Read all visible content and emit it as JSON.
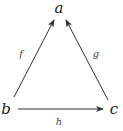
{
  "diagram": {
    "type": "commutative-triangle",
    "nodes": [
      {
        "id": "a",
        "label": "a",
        "x": 59,
        "y": 13
      },
      {
        "id": "b",
        "label": "b",
        "x": 6,
        "y": 114
      },
      {
        "id": "c",
        "label": "c",
        "x": 113,
        "y": 114
      }
    ],
    "edges": [
      {
        "id": "f",
        "label": "f",
        "from": "b",
        "to": "a"
      },
      {
        "id": "g",
        "label": "g",
        "from": "c",
        "to": "a"
      },
      {
        "id": "h",
        "label": "h",
        "from": "b",
        "to": "c"
      }
    ],
    "colors": {
      "stroke": "#333333",
      "text": "#222222"
    }
  }
}
